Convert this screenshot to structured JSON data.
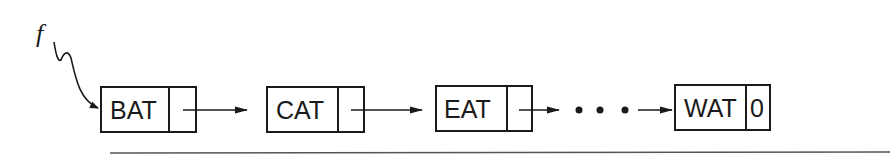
{
  "diagram": {
    "type": "singly-linked-list",
    "pointer": {
      "label": "f",
      "points_to": "BAT"
    },
    "nodes": [
      {
        "data": "BAT",
        "link": "arrow"
      },
      {
        "data": "CAT",
        "link": "arrow"
      },
      {
        "data": "EAT",
        "link": "arrow"
      },
      {
        "data": "WAT",
        "link": "0"
      }
    ],
    "ellipsis": "• • •",
    "colors": {
      "ink": "#1a1a1a",
      "background": "#ffffff"
    }
  }
}
